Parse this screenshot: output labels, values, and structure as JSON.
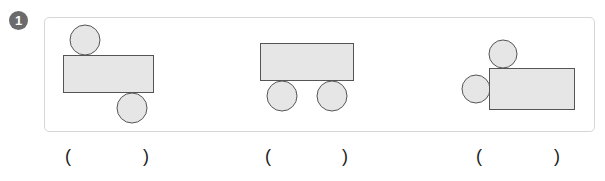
{
  "problem": {
    "number": "1",
    "colors": {
      "shape_fill": "#e6e6e6",
      "shape_stroke": "#555555",
      "card_border": "#d6d6d6",
      "badge": "#6b6b6b"
    },
    "figures": [
      {
        "id": "figure-1",
        "description": "rectangle with circle above-left and circle below-right",
        "answer_open": "(",
        "answer_close": ")"
      },
      {
        "id": "figure-2",
        "description": "rectangle with two circles below",
        "answer_open": "(",
        "answer_close": ")"
      },
      {
        "id": "figure-3",
        "description": "rectangle with circle above-left and circle left",
        "answer_open": "(",
        "answer_close": ")"
      }
    ]
  }
}
